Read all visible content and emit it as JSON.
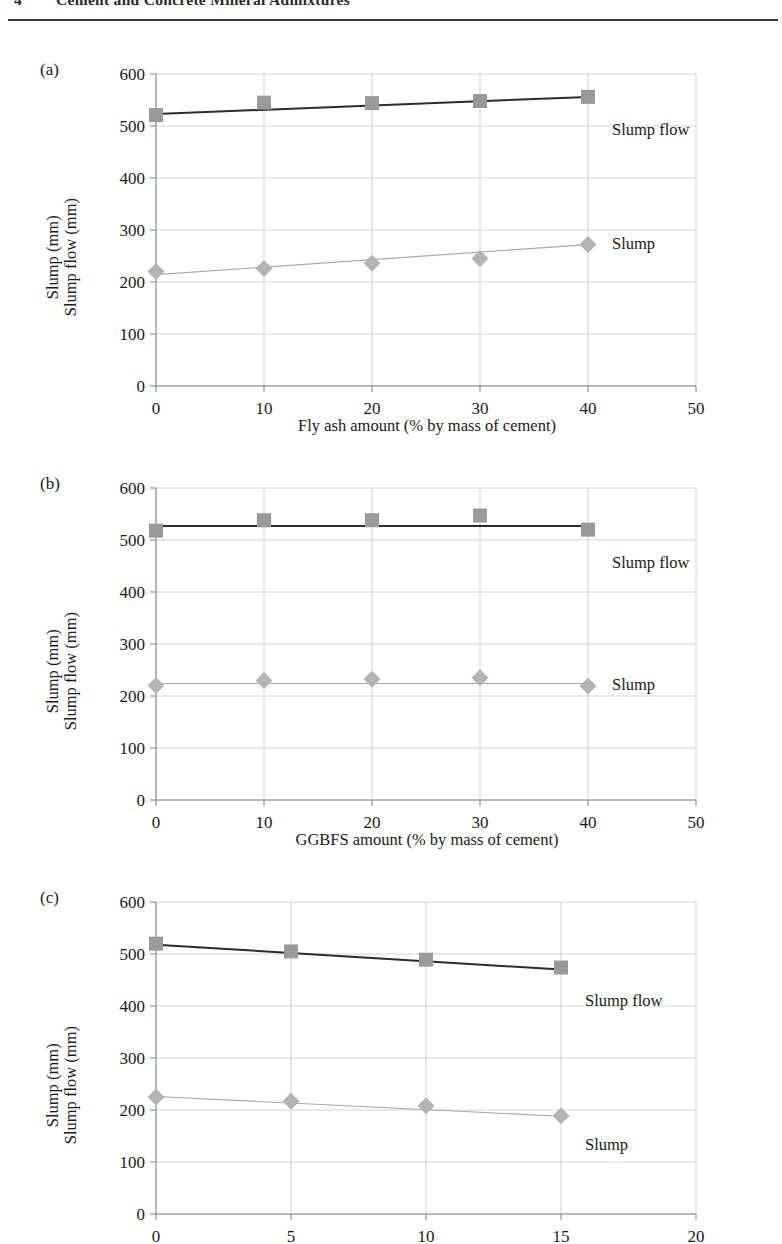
{
  "header": {
    "folio": "4",
    "title": "Cement and Concrete Mineral Admixtures"
  },
  "axis_titles": {
    "y_line1": "Slump (mm)",
    "y_line2": "Slump flow (mm)"
  },
  "series_labels": {
    "slump_flow": "Slump flow",
    "slump": "Slump"
  },
  "colors": {
    "slump_flow_line": "#2b2b2b",
    "slump_flow_marker": "#9a9a9a",
    "slump_line": "#a8a8a8",
    "slump_marker": "#b4b4b4",
    "grid": "#c9c9c9",
    "axis": "#8c8c8c",
    "text": "#1a1a1a"
  },
  "panels": [
    {
      "tag": "(a)",
      "chart_data": {
        "type": "line",
        "title": "",
        "xlabel": "Fly ash amount (% by mass of cement)",
        "ylabel": "Slump (mm) Slump flow (mm)",
        "x": [
          0,
          10,
          20,
          30,
          40
        ],
        "xlim": [
          0,
          50
        ],
        "ylim": [
          0,
          600
        ],
        "xticks": [
          0,
          10,
          20,
          30,
          40,
          50
        ],
        "yticks": [
          0,
          100,
          200,
          300,
          400,
          500,
          600
        ],
        "grid": true,
        "legend": "inline-right",
        "series": [
          {
            "name": "Slump flow",
            "values": [
              521,
              545,
              544,
              548,
              556
            ],
            "marker": "square"
          },
          {
            "name": "Slump",
            "values": [
              220,
              226,
              236,
              245,
              272
            ],
            "marker": "diamond"
          }
        ],
        "trendlines": [
          {
            "name": "Slump flow",
            "y_start": 523,
            "y_end": 556
          },
          {
            "name": "Slump",
            "y_start": 214,
            "y_end": 272
          }
        ]
      }
    },
    {
      "tag": "(b)",
      "chart_data": {
        "type": "line",
        "title": "",
        "xlabel": "GGBFS amount (% by mass of cement)",
        "ylabel": "Slump (mm) Slump flow (mm)",
        "x": [
          0,
          10,
          20,
          30,
          40
        ],
        "xlim": [
          0,
          50
        ],
        "ylim": [
          0,
          600
        ],
        "xticks": [
          0,
          10,
          20,
          30,
          40,
          50
        ],
        "yticks": [
          0,
          100,
          200,
          300,
          400,
          500,
          600
        ],
        "grid": true,
        "legend": "inline-right",
        "series": [
          {
            "name": "Slump flow",
            "values": [
              518,
              538,
              538,
              547,
              520
            ],
            "marker": "square"
          },
          {
            "name": "Slump",
            "values": [
              220,
              230,
              232,
              235,
              219
            ],
            "marker": "diamond"
          }
        ],
        "trendlines": [
          {
            "name": "Slump flow",
            "y_start": 527,
            "y_end": 527
          },
          {
            "name": "Slump",
            "y_start": 224,
            "y_end": 224
          }
        ]
      }
    },
    {
      "tag": "(c)",
      "chart_data": {
        "type": "line",
        "title": "",
        "xlabel": "",
        "ylabel": "Slump (mm) Slump flow (mm)",
        "x": [
          0,
          5,
          10,
          15
        ],
        "xlim": [
          0,
          20
        ],
        "ylim": [
          0,
          600
        ],
        "xticks": [
          0,
          5,
          10,
          15,
          20
        ],
        "yticks": [
          0,
          100,
          200,
          300,
          400,
          500,
          600
        ],
        "grid": true,
        "legend": "inline-right",
        "series": [
          {
            "name": "Slump flow",
            "values": [
              520,
              505,
              489,
              474
            ],
            "marker": "square"
          },
          {
            "name": "Slump",
            "values": [
              225,
              217,
              208,
              189
            ],
            "marker": "diamond"
          }
        ],
        "trendlines": [
          {
            "name": "Slump flow",
            "y_start": 518,
            "y_end": 470
          },
          {
            "name": "Slump",
            "y_start": 226,
            "y_end": 188
          }
        ]
      }
    }
  ]
}
